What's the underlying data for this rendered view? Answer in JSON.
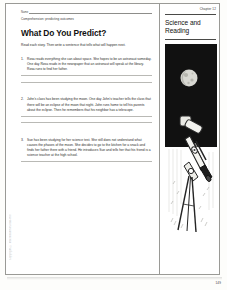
{
  "document": {
    "name_label": "Name",
    "skill_line": "Comprehension: predicting outcomes",
    "title": "What Do You Predict?",
    "directions": "Read each story. Then write a sentence that tells what will happen next.",
    "margin_note": "Copyright © Macmillan/McGraw-Hill",
    "page_number": "149"
  },
  "sidebar": {
    "chapter_label": "Chapter 12",
    "subject_title": "Science and Reading",
    "illustration_name": "telescope-and-moon-illustration",
    "illustration_caption": "Telescope on a tripod pointed at the moon in a night sky"
  },
  "items": [
    {
      "number": "1.",
      "text": "Rosa reads everything she can about space. She hopes to be an astronaut someday. One day Rosa reads in the newspaper that an astronaut will speak at the library. Rosa runs to find her father.",
      "answer_lines": 2
    },
    {
      "number": "2.",
      "text": "John's class has been studying the moon. One day John's teacher tells the class that there will be an eclipse of the moon that night. John runs home to tell his parents about the eclipse. Then he remembers that his neighbor has a telescope.",
      "answer_lines": 2
    },
    {
      "number": "3.",
      "text": "Sue has been studying for her science test. She still does not understand what causes the phases of the moon. She decides to go to the kitchen for a snack and finds her father there with a friend. He introduces Sue and tells her that his friend is a science teacher at the high school.",
      "answer_lines": 1
    }
  ],
  "colors": {
    "paper": "#ffffff",
    "border": "#9a9a96",
    "text": "#2a2a28",
    "rule": "#b9b9b5",
    "night_sky": "#111111"
  }
}
